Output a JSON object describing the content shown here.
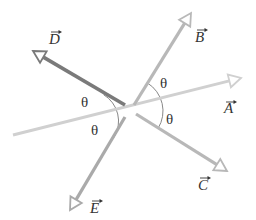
{
  "diagram": {
    "type": "vector-diagram",
    "center": [
      130,
      111
    ],
    "vectors": [
      {
        "id": "A",
        "label": "A",
        "from": [
          13,
          135
        ],
        "to": [
          241,
          78
        ],
        "color": "#d0d0d0",
        "width": 3,
        "label_pos": [
          224,
          113
        ],
        "arrow_pos": [
          229,
          102
        ]
      },
      {
        "id": "B",
        "label": "B",
        "from": [
          134,
          105
        ],
        "to": [
          191,
          13
        ],
        "color": "#b8b8b8",
        "width": 3.2,
        "label_pos": [
          195,
          42
        ],
        "arrow_pos": [
          200,
          30
        ]
      },
      {
        "id": "C",
        "label": "C",
        "from": [
          136,
          114
        ],
        "to": [
          227,
          171
        ],
        "color": "#b8b8b8",
        "width": 3.2,
        "label_pos": [
          198,
          190
        ],
        "arrow_pos": [
          203,
          178
        ]
      },
      {
        "id": "D",
        "label": "D",
        "from": [
          125,
          105
        ],
        "to": [
          33,
          51
        ],
        "color": "#7a7a7a",
        "width": 3.6,
        "label_pos": [
          49,
          44
        ],
        "arrow_pos": [
          54,
          32
        ]
      },
      {
        "id": "E",
        "label": "E",
        "from": [
          125,
          117
        ],
        "to": [
          70,
          210
        ],
        "color": "#aaaaaa",
        "width": 3.2,
        "label_pos": [
          90,
          213
        ],
        "arrow_pos": [
          95,
          201
        ]
      }
    ],
    "angle_label": "θ",
    "angles": [
      {
        "label": "θ",
        "pos": [
          81,
          107
        ]
      },
      {
        "label": "θ",
        "pos": [
          91,
          135
        ]
      },
      {
        "label": "θ",
        "pos": [
          160,
          88
        ]
      },
      {
        "label": "θ",
        "pos": [
          166,
          124
        ]
      }
    ],
    "arcs": [
      {
        "side": "left",
        "radius": 31
      },
      {
        "side": "right",
        "radius": 33
      }
    ]
  }
}
